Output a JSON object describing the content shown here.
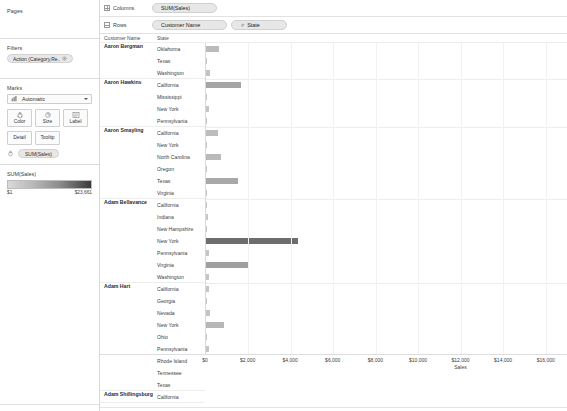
{
  "left_panel": {
    "pages": {
      "title": "Pages"
    },
    "filters": {
      "title": "Filters",
      "pill_label": "Action (Category,Re..",
      "pill_icon": "filter-target-icon"
    },
    "marks": {
      "title": "Marks",
      "type_value": "Automatic",
      "type_icon": "bar-mark-icon",
      "buttons": [
        {
          "name": "color",
          "label": "Color",
          "icon": "color-palette-icon"
        },
        {
          "name": "size",
          "label": "Size",
          "icon": "size-circle-icon"
        },
        {
          "name": "label",
          "label": "Label",
          "icon": "label-text-icon"
        },
        {
          "name": "detail",
          "label": "Detail",
          "icon": "detail-icon"
        },
        {
          "name": "tooltip",
          "label": "Tooltip",
          "icon": "tooltip-icon"
        }
      ],
      "field_pill": "SUM(Sales)",
      "field_pill_icon": "color-palette-icon"
    },
    "legend": {
      "title": "SUM(Sales)",
      "min": "$1",
      "max": "$23,661",
      "gradient_from": "#d9d9d9",
      "gradient_to": "#3a3a3a"
    }
  },
  "shelves": {
    "columns": {
      "label": "Columns",
      "icon": "columns-grid-icon",
      "pills": [
        "SUM(Sales)"
      ]
    },
    "rows": {
      "label": "Rows",
      "icon": "rows-grid-icon",
      "pills": [
        "Customer Name",
        "State"
      ]
    }
  },
  "table": {
    "headers": {
      "customer": "Customer Name",
      "state": "State"
    }
  },
  "chart_data": {
    "type": "bar",
    "title": "",
    "xlabel": "Sales",
    "ylabel": "",
    "xlim": [
      0,
      17000
    ],
    "grid": true,
    "orientation": "horizontal",
    "xticks": [
      "$0",
      "$2,000",
      "$4,000",
      "$6,000",
      "$8,000",
      "$10,000",
      "$12,000",
      "$14,000",
      "$16,000"
    ],
    "xtick_values": [
      0,
      2000,
      4000,
      6000,
      8000,
      10000,
      12000,
      14000,
      16000
    ],
    "color_field": "SUM(Sales)",
    "groups": [
      {
        "customer": "Aaron Bergman",
        "categories": [
          "Oklahoma",
          "Texas",
          "Washington"
        ],
        "values": [
          620,
          25,
          210
        ]
      },
      {
        "customer": "Aaron Hawkins",
        "categories": [
          "California",
          "Mississippi",
          "New York",
          "Pennsylvania"
        ],
        "values": [
          1640,
          35,
          160,
          30
        ]
      },
      {
        "customer": "Aaron Smayling",
        "categories": [
          "California",
          "New York",
          "North Carolina",
          "Oregon",
          "Texas",
          "Virginia"
        ],
        "values": [
          560,
          30,
          690,
          30,
          1530,
          25
        ]
      },
      {
        "customer": "Adam Bellavance",
        "categories": [
          "California",
          "Indiana",
          "New Hampshire",
          "New York",
          "Pennsylvania",
          "Virginia",
          "Washington"
        ],
        "values": [
          40,
          110,
          30,
          4320,
          130,
          1960,
          140
        ]
      },
      {
        "customer": "Adam Hart",
        "categories": [
          "California",
          "Georgia",
          "Nevada",
          "New York",
          "Ohio",
          "Pennsylvania",
          "Rhode Island",
          "Tennessee",
          "Texas"
        ],
        "values": [
          140,
          35,
          170,
          860,
          35,
          120,
          1280,
          190,
          120
        ]
      },
      {
        "customer": "Adam Shillingsburg",
        "categories": [
          "California"
        ],
        "values": [
          160
        ]
      }
    ]
  }
}
